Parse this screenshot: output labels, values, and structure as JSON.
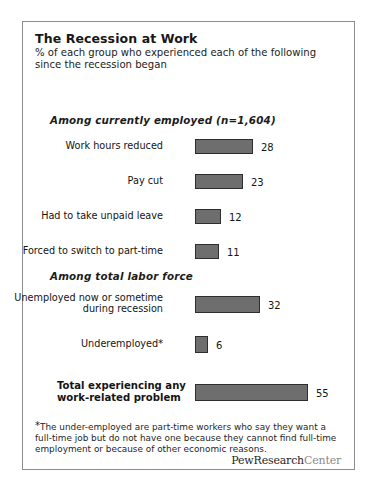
{
  "figure": {
    "title": "The Recession at Work",
    "subtitle": "% of each group who experienced each of the following since the recession began",
    "footnote_marker": "*",
    "footnote": "The under-employed are part-time workers who say they want a full-time job but do not have one because they cannot find full-time employment or because of other economic reasons.",
    "brand_part1": "PewResearch",
    "brand_part2": "Center",
    "bar_color": "#6e6e6e",
    "bar_border_color": "#2e2e2e",
    "frame_border_color": "#8d8d8d"
  },
  "chart_data": {
    "type": "bar",
    "orientation": "horizontal",
    "title": "The Recession at Work",
    "subtitle": "% of each group who experienced each of the following since the recession began",
    "xlabel": "",
    "ylabel": "",
    "xlim": [
      0,
      55
    ],
    "grid": false,
    "legend": "none",
    "value_unit": "%",
    "groups": [
      {
        "heading": "Among currently employed (n=1,604)",
        "categories": [
          "Work hours reduced",
          "Pay cut",
          "Had to take unpaid leave",
          "Forced to switch to part-time"
        ],
        "values": [
          28,
          23,
          12,
          11
        ]
      },
      {
        "heading": "Among total labor force",
        "categories": [
          "Unemployed now or sometime\nduring recession",
          "Underemployed*"
        ],
        "values": [
          32,
          6
        ]
      },
      {
        "heading": "",
        "categories": [
          "Total experiencing any\nwork-related problem"
        ],
        "values": [
          55
        ]
      }
    ],
    "categories": [
      "Work hours reduced",
      "Pay cut",
      "Had to take unpaid leave",
      "Forced to switch to part-time",
      "Unemployed now or sometime during recession",
      "Underemployed*",
      "Total experiencing any work-related problem"
    ],
    "values": [
      28,
      23,
      12,
      11,
      32,
      6,
      55
    ]
  },
  "rows": [
    {
      "label": "Work hours reduced",
      "value": 28,
      "value_text": "28",
      "top": 116,
      "width": 58,
      "tall": false,
      "bold": false
    },
    {
      "label": "Pay cut",
      "value": 23,
      "value_text": "23",
      "top": 151,
      "width": 48,
      "tall": false,
      "bold": false
    },
    {
      "label": "Had to take unpaid leave",
      "value": 12,
      "value_text": "12",
      "top": 186,
      "width": 26,
      "tall": false,
      "bold": false
    },
    {
      "label": "Forced to switch to part-time",
      "value": 11,
      "value_text": "11",
      "top": 221,
      "width": 24,
      "tall": false,
      "bold": false
    },
    {
      "label": "Unemployed now or sometime\nduring recession",
      "value": 32,
      "value_text": "32",
      "top": 274,
      "width": 65,
      "tall": true,
      "bold": false
    },
    {
      "label": "Underemployed*",
      "value": 6,
      "value_text": "6",
      "top": 314,
      "width": 13,
      "tall": true,
      "bold": false
    },
    {
      "label": "Total experiencing any\nwork-related problem",
      "value": 55,
      "value_text": "55",
      "top": 362,
      "width": 113,
      "tall": true,
      "bold": true
    }
  ],
  "group_headings": [
    {
      "text": "Among currently employed (n=1,604)",
      "top": 92
    },
    {
      "text": "Among total labor force",
      "top": 248
    }
  ]
}
